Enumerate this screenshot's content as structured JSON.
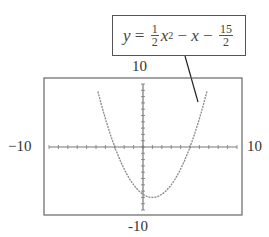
{
  "chart_data": {
    "type": "line",
    "title": "",
    "equation": {
      "lhs": "y",
      "coef_num": "1",
      "coef_den": "2",
      "var": "x",
      "exp": "2",
      "term2": "x",
      "const_num": "15",
      "const_den": "2",
      "text": "y = 1/2 x^2 - x - 15/2"
    },
    "xlim": [
      -10,
      10
    ],
    "ylim": [
      -10,
      10
    ],
    "tick_labels": {
      "ymax": "10",
      "ymin": "-10",
      "xmin": "−10",
      "xmax": "10"
    },
    "xmin_label": "−10",
    "ymin_label": "−10",
    "grid": false,
    "x_tick_step": 1,
    "y_tick_step": 1,
    "series": [
      {
        "name": "y = 1/2 x^2 - x - 15/2",
        "x": [
          -4.8,
          -4,
          -3,
          -2,
          -1,
          0,
          1,
          2,
          3,
          4,
          5,
          6,
          6.8
        ],
        "y": [
          9.8,
          4.5,
          0,
          -3.5,
          -6,
          -7.5,
          -8,
          -7.5,
          -6,
          -3.5,
          0,
          4.5,
          8.8
        ]
      }
    ],
    "roots": [
      -3,
      5
    ],
    "vertex": [
      1,
      -8
    ]
  }
}
